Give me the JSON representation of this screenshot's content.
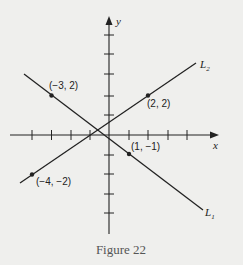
{
  "figure": {
    "caption": "Figure 22",
    "axes": {
      "x_label": "x",
      "y_label": "y",
      "origin_px": [
        109,
        135
      ],
      "unit_px": 19.4,
      "x_ticks": [
        -4,
        -3,
        -2,
        -1,
        1,
        2,
        3,
        4
      ],
      "y_ticks": [
        -4,
        -3,
        -2,
        -1,
        1,
        2,
        3,
        4
      ]
    },
    "lines": [
      {
        "name": "L1",
        "label_main": "L",
        "label_sub": "1",
        "points": [
          {
            "x": -3,
            "y": 2,
            "label": "(−3, 2)"
          },
          {
            "x": 1,
            "y": -1,
            "label": "(1, −1)"
          }
        ]
      },
      {
        "name": "L2",
        "label_main": "L",
        "label_sub": "2",
        "points": [
          {
            "x": -4,
            "y": -2,
            "label": "(−4, −2)"
          },
          {
            "x": 2,
            "y": 2,
            "label": "(2, 2)"
          }
        ]
      }
    ],
    "colors": {
      "background": "#efefed",
      "ink": "#222222",
      "caption": "#555555"
    }
  }
}
